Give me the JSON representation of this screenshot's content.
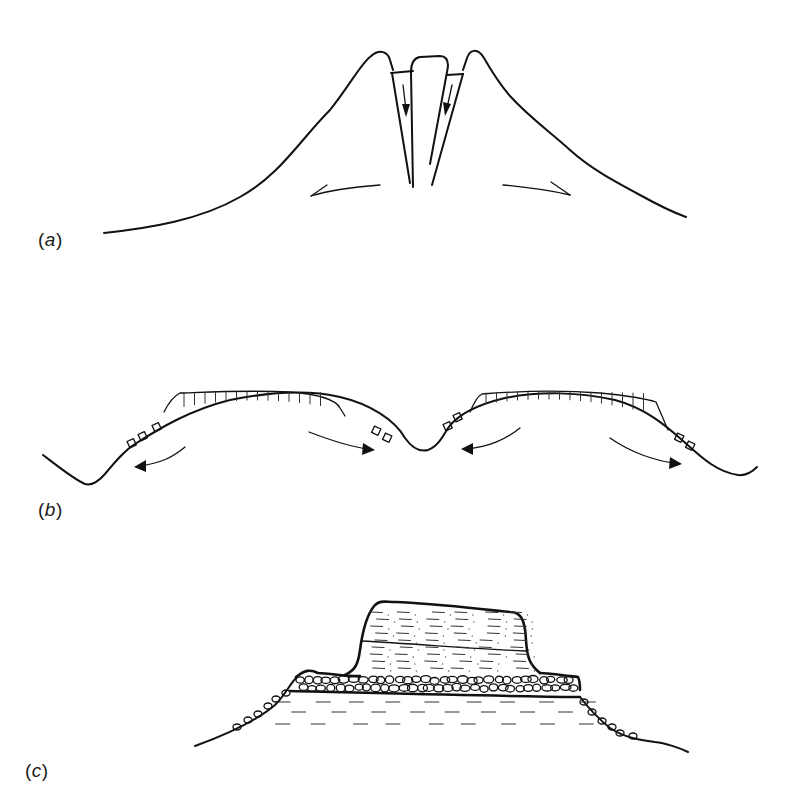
{
  "figure": {
    "type": "geomorphology cross-section diagram",
    "line_color": "#111111",
    "background": "#ffffff"
  },
  "panels": [
    {
      "id": "a",
      "label_open": "(",
      "label_letter": "a",
      "label_close": ")",
      "description": "Ridge with central graben/trough block; downward arrows in fissures, outward arrows on flanks"
    },
    {
      "id": "b",
      "label_open": "(",
      "label_letter": "b",
      "label_close": ")",
      "description": "Two rounded hills with capping columnar layer, small blocks on slopes, curved arrows indicating outward movement"
    },
    {
      "id": "c",
      "label_open": "(",
      "label_letter": "c",
      "label_close": ")",
      "description": "Flat-topped mesa: dotted/dashed upper beds over a boulder/cobble layer over dashed lower beds, rounded boulders on flanking slopes"
    }
  ]
}
